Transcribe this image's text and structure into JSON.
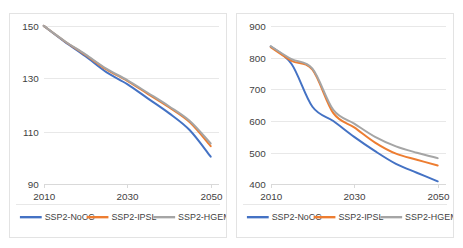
{
  "figure": {
    "background": "#ffffff",
    "panel_border_color": "#e3e3e3",
    "gridline_color": "#e8e8e8"
  },
  "series_style": [
    {
      "key": "nocc",
      "name": "SSP2-NoCC",
      "color": "#4472c4"
    },
    {
      "key": "ipsl",
      "name": "SSP2-IPSL",
      "color": "#ed7d31"
    },
    {
      "key": "hgem",
      "name": "SSP2-HGEM",
      "color": "#a5a5a5"
    }
  ],
  "chart_data": [
    {
      "id": "left-chart",
      "type": "line",
      "title": "",
      "xlabel": "",
      "ylabel": "",
      "x": [
        2010,
        2015,
        2020,
        2025,
        2030,
        2035,
        2040,
        2045,
        2050
      ],
      "xlim": [
        2010,
        2052
      ],
      "ylim": [
        90,
        150
      ],
      "yticks": [
        90,
        110,
        130,
        150
      ],
      "xticks": [
        2010,
        2030,
        2050
      ],
      "grid": true,
      "legend_position": "bottom",
      "series": [
        {
          "name": "SSP2-NoCC",
          "color": "#4472c4",
          "values": [
            150.0,
            144.0,
            138.5,
            132.5,
            128.0,
            122.5,
            117.0,
            110.5,
            100.5
          ]
        },
        {
          "name": "SSP2-IPSL",
          "color": "#ed7d31",
          "values": [
            150.0,
            144.2,
            139.0,
            133.5,
            129.2,
            124.2,
            119.2,
            113.5,
            104.5
          ]
        },
        {
          "name": "SSP2-HGEM",
          "color": "#a5a5a5",
          "values": [
            150.0,
            144.3,
            139.2,
            133.8,
            129.5,
            124.6,
            119.6,
            114.0,
            105.5
          ]
        }
      ]
    },
    {
      "id": "right-chart",
      "type": "line",
      "title": "",
      "xlabel": "",
      "ylabel": "",
      "x": [
        2010,
        2015,
        2020,
        2025,
        2030,
        2035,
        2040,
        2045,
        2050
      ],
      "xlim": [
        2010,
        2052
      ],
      "ylim": [
        400,
        900
      ],
      "yticks": [
        400,
        500,
        600,
        700,
        800,
        900
      ],
      "xticks": [
        2010,
        2030,
        2050
      ],
      "grid": true,
      "legend_position": "bottom",
      "series": [
        {
          "name": "SSP2-NoCC",
          "color": "#4472c4",
          "values": [
            835,
            780,
            645,
            600,
            550,
            505,
            465,
            437,
            410
          ]
        },
        {
          "name": "SSP2-IPSL",
          "color": "#ed7d31",
          "values": [
            833,
            790,
            762,
            625,
            580,
            532,
            497,
            478,
            460
          ]
        },
        {
          "name": "SSP2-HGEM",
          "color": "#a5a5a5",
          "values": [
            836,
            795,
            765,
            635,
            592,
            550,
            520,
            500,
            483
          ]
        }
      ]
    }
  ]
}
